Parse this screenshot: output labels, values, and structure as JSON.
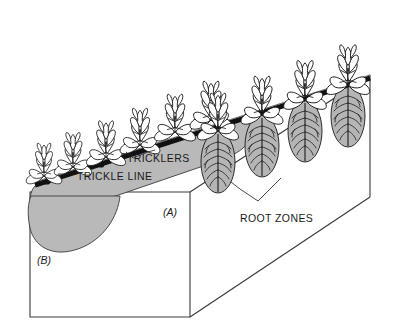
{
  "figure": {
    "background_color": "#ffffff"
  },
  "labels": {
    "tricklers": "TRICKLERS",
    "trickle_line": "TRICKLE LINE",
    "root_zones": "ROOT ZONES",
    "panel_a": "(A)",
    "panel_b": "(B)"
  },
  "colors": {
    "outline": "#3a3a3a",
    "soil_block_fill": "#ffffff",
    "wetted_strip_fill": "#b9b9b9",
    "root_zone_fill": "#b5b5b5",
    "trickle_line": "#111111",
    "leaf_fill": "#ffffff",
    "leaf_outline": "#1a1a1a",
    "root_stroke": "#1a1a1a",
    "text": "#1a1a1a"
  },
  "geometry": {
    "soil_block": {
      "front_face": "30,192 190,192 190,317 30,317",
      "top_right_edge": "190,192 370,75",
      "bottom_right_edge": "190,317 370,197",
      "right_edge": "370,75 370,197"
    },
    "trickle_line": {
      "start": [
        35,
        185
      ],
      "end": [
        370,
        78
      ],
      "thickness": 5
    }
  },
  "plants": {
    "back_row_count": 5,
    "front_row_count": 5,
    "description": "Leafy seedlings spaced along the trickle line"
  },
  "root_zones": {
    "count": 4,
    "shape": "oval",
    "description": "Individual wetted bulbs beneath each trickler with branching roots"
  }
}
